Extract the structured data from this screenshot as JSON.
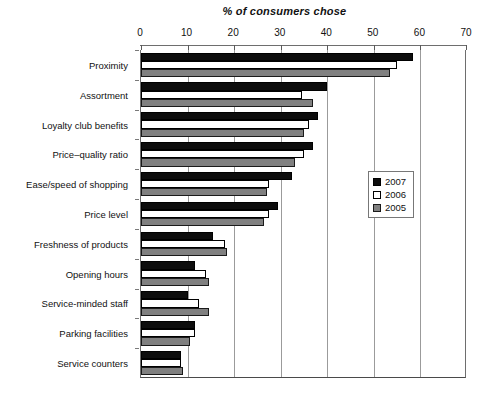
{
  "chart_data": {
    "type": "bar",
    "orientation": "horizontal",
    "title": "% of consumers chose",
    "xlabel": "",
    "ylabel": "",
    "xlim": [
      0,
      70
    ],
    "xticks": [
      0,
      10,
      20,
      30,
      40,
      50,
      60,
      70
    ],
    "xtick_labels": [
      "0",
      "10",
      "20",
      "30",
      "40",
      "50",
      "60",
      "70"
    ],
    "grid": true,
    "grid_axis": "x",
    "legend_position": "inside-right",
    "categories": [
      "Proximity",
      "Assortment",
      "Loyalty club benefits",
      "Price–quality ratio",
      "Ease/speed of shopping",
      "Price level",
      "Freshness of products",
      "Opening hours",
      "Service-minded staff",
      "Parking facilities",
      "Service counters"
    ],
    "series": [
      {
        "name": "2007",
        "color": "#0d0d0d",
        "values": [
          58.5,
          40,
          38,
          37,
          32.5,
          29.5,
          15.5,
          11.5,
          10,
          11.5,
          8.5
        ]
      },
      {
        "name": "2006",
        "color": "#ffffff",
        "values": [
          55,
          34.5,
          36,
          35,
          27.5,
          27.5,
          18,
          14,
          12.5,
          11.5,
          8.5
        ]
      },
      {
        "name": "2005",
        "color": "#808080",
        "values": [
          53.5,
          37,
          35,
          33,
          27,
          26.5,
          18.5,
          14.5,
          14.5,
          10.5,
          9
        ]
      }
    ]
  },
  "legend": {
    "entries": [
      {
        "label": "2007",
        "swatch": "y2007"
      },
      {
        "label": "2006",
        "swatch": "y2006"
      },
      {
        "label": "2005",
        "swatch": "y2005"
      }
    ]
  }
}
